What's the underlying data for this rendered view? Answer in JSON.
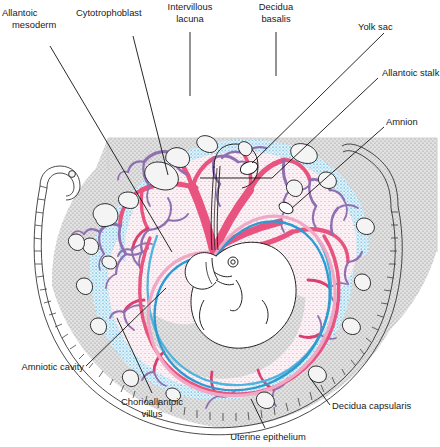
{
  "figure": {
    "background_color": "#ffffff"
  },
  "labels": {
    "allantoic_mesoderm_line1": "Allantoic",
    "allantoic_mesoderm_line2": "mesoderm",
    "cytotrophoblast": "Cytotrophoblast",
    "intervillous_lacuna_line1": "Intervillous",
    "intervillous_lacuna_line2": "lacuna",
    "decidua_basalis_line1": "Decidua",
    "decidua_basalis_line2": "basalis",
    "yolk_sac": "Yolk sac",
    "allantoic_stalk": "Allantoic stalk",
    "amnion": "Amnion",
    "amniotic_cavity": "Amniotic cavity",
    "chorioallantoic_villus_line1": "Chorioallantoic",
    "chorioallantoic_villus_line2": "villus",
    "uterine_epithelium": "Uterine epithelium",
    "decidua_capsularis": "Decidua capsularis"
  },
  "colors": {
    "decidua_fill": "#dedede",
    "decidua_stipple": "#7d7d7d",
    "chorion_pink_fill": "#fbe7ef",
    "villus_pink": "#e8537f",
    "villus_deep_pink": "#d94070",
    "villus_purple": "#8f6fb0",
    "cytotrophoblast_blue": "#4fb3dd",
    "cytotrophoblast_light": "#9ed8ee",
    "amnion_blue": "#2e9ad0",
    "amnion_pink": "#f0a8c4",
    "outline_black": "#1a1a1a",
    "epithelium_line": "#2a2a2a",
    "label_text": "#1a1a1a"
  },
  "structures": [
    {
      "name": "decidua-basalis",
      "description": "thick stippled gray maternal tissue at top of section"
    },
    {
      "name": "decidua-capsularis",
      "description": "stippled gray maternal layer enclosing the conceptus"
    },
    {
      "name": "uterine-epithelium",
      "description": "cellular brick-pattern border around outer rim"
    },
    {
      "name": "cytotrophoblast-shell",
      "description": "light blue stippled shell lining the chorion"
    },
    {
      "name": "intervillous-lacuna",
      "description": "pale stippled spaces between branching villi"
    },
    {
      "name": "chorioallantoic-villus",
      "description": "branching pink and purple villous trees"
    },
    {
      "name": "amnion",
      "description": "blue and pink double membrane surrounding embryo"
    },
    {
      "name": "amniotic-cavity",
      "description": "clear space inside the amnion"
    },
    {
      "name": "embryo",
      "description": "curled embryo with eye, limb buds and tail"
    },
    {
      "name": "allantoic-stalk",
      "description": "narrow stalk connecting embryo to chorion"
    },
    {
      "name": "yolk-sac",
      "description": "small oval vesicle beside the allantoic stalk"
    },
    {
      "name": "uterine-glands",
      "description": "small irregular outlined glands in the decidua"
    }
  ]
}
